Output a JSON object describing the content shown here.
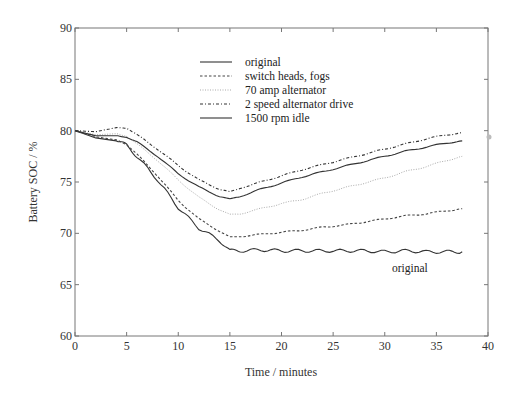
{
  "chart_data": {
    "type": "line",
    "title": "",
    "xlabel": "Time / minutes",
    "ylabel": "Battery SOC / %",
    "xlim": [
      0,
      40
    ],
    "ylim": [
      60,
      90
    ],
    "xticks": [
      0,
      5,
      10,
      15,
      20,
      25,
      30,
      35,
      40
    ],
    "yticks": [
      60,
      65,
      70,
      75,
      80,
      85,
      90
    ],
    "grid": false,
    "legend_position": "upper-center",
    "legend": [
      "original",
      "switch heads, fogs",
      "70 amp alternator",
      "2 speed alternator drive",
      "1500 rpm idle"
    ],
    "annotations": [
      {
        "text": "original",
        "x": 31,
        "y": 66.7
      }
    ],
    "series": [
      {
        "name": "original",
        "style": "solid-wavy",
        "color": "#333333",
        "x": [
          0,
          2,
          4,
          5,
          6,
          8,
          10,
          12,
          14,
          15,
          16,
          18,
          20,
          22,
          24,
          26,
          28,
          30,
          32,
          34,
          36,
          37.5
        ],
        "y": [
          80,
          79.3,
          79.0,
          78.6,
          77.5,
          75.2,
          72.5,
          70.5,
          69.3,
          68.3,
          68.3,
          68.4,
          68.3,
          68.3,
          68.3,
          68.3,
          68.3,
          68.2,
          68.3,
          68.2,
          68.2,
          68.2
        ]
      },
      {
        "name": "switch heads, fogs",
        "style": "dashed",
        "color": "#444444",
        "x": [
          0,
          2,
          4,
          5,
          6,
          8,
          10,
          12,
          14,
          15,
          16,
          18,
          20,
          22,
          24,
          26,
          28,
          30,
          32,
          34,
          36,
          37.5
        ],
        "y": [
          80,
          79.4,
          79.1,
          78.7,
          77.7,
          75.6,
          73.2,
          71.4,
          70.2,
          69.6,
          69.7,
          69.9,
          70.1,
          70.3,
          70.6,
          70.8,
          71.1,
          71.4,
          71.7,
          71.9,
          72.2,
          72.4
        ]
      },
      {
        "name": "70 amp alternator",
        "style": "dotted",
        "color": "#aaaaaa",
        "x": [
          0,
          2,
          4,
          5,
          6,
          8,
          10,
          12,
          14,
          15,
          16,
          18,
          20,
          22,
          24,
          26,
          28,
          30,
          32,
          34,
          36,
          37.5
        ],
        "y": [
          80,
          79.6,
          79.7,
          79.5,
          78.7,
          77.1,
          75.2,
          73.5,
          72.3,
          71.8,
          71.9,
          72.4,
          72.9,
          73.3,
          73.9,
          74.4,
          74.9,
          75.4,
          76.0,
          76.5,
          77.1,
          77.5
        ]
      },
      {
        "name": "2 speed alternator drive",
        "style": "dashdot",
        "color": "#333333",
        "x": [
          0,
          2,
          4,
          5,
          6,
          8,
          10,
          12,
          14,
          15,
          16,
          18,
          20,
          22,
          24,
          26,
          28,
          30,
          32,
          34,
          36,
          37.5
        ],
        "y": [
          80,
          79.9,
          80.3,
          80.3,
          79.6,
          78.2,
          76.6,
          75.2,
          74.3,
          74.0,
          74.4,
          75.0,
          75.6,
          76.2,
          76.7,
          77.2,
          77.7,
          78.2,
          78.7,
          79.2,
          79.6,
          79.8
        ]
      },
      {
        "name": "1500 rpm idle",
        "style": "solid",
        "color": "#333333",
        "x": [
          0,
          2,
          4,
          5,
          6,
          8,
          10,
          12,
          14,
          15,
          16,
          18,
          20,
          22,
          24,
          26,
          28,
          30,
          32,
          34,
          36,
          37.5
        ],
        "y": [
          80,
          79.5,
          79.5,
          79.4,
          78.9,
          77.5,
          75.8,
          74.5,
          73.6,
          73.3,
          73.6,
          74.3,
          74.9,
          75.5,
          76.0,
          76.5,
          77.0,
          77.5,
          78.0,
          78.4,
          78.8,
          79.0
        ]
      }
    ]
  },
  "legend_labels": [
    "original",
    "switch heads, fogs",
    "70 amp alternator",
    "2 speed alternator drive",
    "1500 rpm idle"
  ]
}
